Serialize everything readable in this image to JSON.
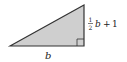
{
  "diagram": {
    "type": "right-triangle",
    "fill_color": "#cfcfcf",
    "stroke_color": "#333333",
    "base_label": "b",
    "height_label": {
      "fraction_numerator": "1",
      "fraction_denominator": "2",
      "variable": "b",
      "operator": "+",
      "constant": "1"
    },
    "right_angle_marker": true
  }
}
